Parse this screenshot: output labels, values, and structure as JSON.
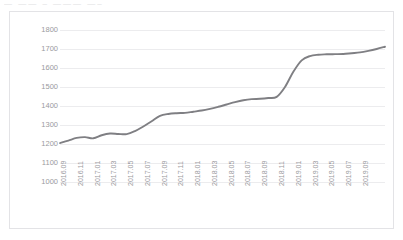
{
  "header": {
    "title_remnant": "—  ——   –  ———  —–"
  },
  "chart_data": {
    "type": "line",
    "title": "",
    "xlabel": "",
    "ylabel": "",
    "ylim": [
      1000,
      1800
    ],
    "yticks": [
      1800,
      1700,
      1600,
      1500,
      1400,
      1300,
      1200,
      1100,
      1000
    ],
    "grid": true,
    "legend": "none",
    "line_color": "#7f7f83",
    "grid_color": "#ececee",
    "axis_label_color": "#9a9a9e",
    "panel_border_color": "#e3e3e6",
    "background_color": "#ffffff",
    "tick_label_rotation": -90,
    "x_tick_step_months": 2,
    "categories": [
      "2016.09",
      "2016.10",
      "2016.11",
      "2016.12",
      "2017.01",
      "2017.02",
      "2017.03",
      "2017.04",
      "2017.05",
      "2017.06",
      "2017.07",
      "2017.08",
      "2017.09",
      "2017.10",
      "2017.11",
      "2017.12",
      "2018.01",
      "2018.02",
      "2018.03",
      "2018.04",
      "2018.05",
      "2018.06",
      "2018.07",
      "2018.08",
      "2018.09",
      "2018.10",
      "2018.11",
      "2018.12",
      "2019.01",
      "2019.02",
      "2019.03",
      "2019.04",
      "2019.05",
      "2019.06",
      "2019.07",
      "2019.08",
      "2019.09"
    ],
    "xticks": [
      "2016.09",
      "2016.11",
      "2017.01",
      "2017.03",
      "2017.05",
      "2017.07",
      "2017.09",
      "2017.11",
      "2018.01",
      "2018.03",
      "2018.05",
      "2018.07",
      "2018.09",
      "2018.11",
      "2019.01",
      "2019.03",
      "2019.05",
      "2019.07",
      "2019.09"
    ],
    "values": [
      1205,
      1218,
      1232,
      1236,
      1230,
      1246,
      1255,
      1253,
      1252,
      1268,
      1292,
      1320,
      1348,
      1358,
      1362,
      1364,
      1370,
      1376,
      1385,
      1396,
      1408,
      1420,
      1430,
      1436,
      1438,
      1442,
      1448,
      1500,
      1580,
      1640,
      1663,
      1670,
      1672,
      1673,
      1674,
      1678,
      1682
    ],
    "values_tail": [
      1690,
      1700,
      1712
    ]
  }
}
